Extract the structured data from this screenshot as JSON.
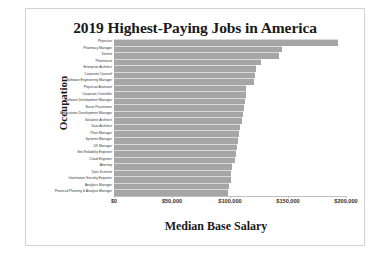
{
  "chart_data": {
    "type": "bar",
    "orientation": "horizontal",
    "title": "2019 Highest-Paying Jobs in America",
    "xlabel": "Median Base Salary",
    "ylabel": "Occupation",
    "xlim": [
      0,
      200000
    ],
    "xticks": [
      0,
      50000,
      100000,
      150000,
      200000
    ],
    "xtick_labels": [
      "$0",
      "$50,000",
      "$100,000",
      "$150,000",
      "$200,000"
    ],
    "grid": false,
    "legend": false,
    "bar_color": "#a6a6a6",
    "categories": [
      "Physician",
      "Pharmacy Manager",
      "Dentist",
      "Pharmacist",
      "Enterprise Architect",
      "Corporate Counsel",
      "Software Engineering Manager",
      "Physician Assistant",
      "Corporate Controller",
      "Software Development Manager",
      "Nurse Practitioner",
      "Applications Development Manager",
      "Solutions Architect",
      "Data Architect",
      "Plant Manager",
      "Systems Manager",
      "UX Manager",
      "Site Reliability Engineer",
      "Cloud Engineer",
      "Attorney",
      "Data Scientist",
      "Information Security Engineer",
      "Analytics Manager",
      "Financial Planning & Analysis Manager"
    ],
    "values": [
      193415,
      144768,
      142478,
      127120,
      122585,
      121900,
      120989,
      113855,
      113368,
      112655,
      111840,
      111000,
      110000,
      108278,
      107435,
      107325,
      106000,
      105000,
      104000,
      102000,
      101000,
      100500,
      99000,
      98000
    ]
  }
}
